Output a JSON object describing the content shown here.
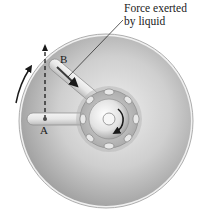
{
  "figure": {
    "callout": {
      "line1": "Force exerted",
      "line2": "by liquid"
    },
    "points": {
      "a": "A",
      "b": "B"
    },
    "colors": {
      "disk_outer": "#c8c8c8",
      "disk_inner": "#9a9a9a",
      "hub": "#b5b5b5",
      "ink": "#1a1a1a"
    }
  }
}
